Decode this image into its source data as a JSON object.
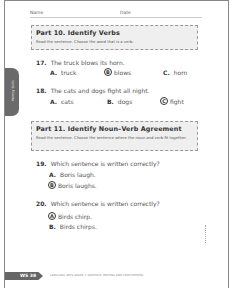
{
  "header": {
    "name_label": "Name",
    "date_label": "Date"
  },
  "side_tab": {
    "label": "Writing Skills"
  },
  "parts": [
    {
      "title": "Part 10. Identify Verbs",
      "instructions": "Read the sentence. Choose the word that is a verb."
    },
    {
      "title": "Part 11. Identify Noun–Verb Agreement",
      "instructions": "Read the sentence. Choose the sentence where the noun and verb fit together."
    }
  ],
  "questions": [
    {
      "number": "17.",
      "text": "The truck blows its horn.",
      "options": [
        {
          "letter": "A.",
          "text": "truck",
          "selected": false
        },
        {
          "letter": "B",
          "text": "blows",
          "selected": true
        },
        {
          "letter": "C.",
          "text": "horn",
          "selected": false
        }
      ]
    },
    {
      "number": "18.",
      "text": "The cats and dogs fight all night.",
      "options": [
        {
          "letter": "A.",
          "text": "cats",
          "selected": false
        },
        {
          "letter": "B.",
          "text": "dogs",
          "selected": false
        },
        {
          "letter": "C",
          "text": "fight",
          "selected": true
        }
      ]
    },
    {
      "number": "19.",
      "text": "Which sentence is written correctly?",
      "options": [
        {
          "letter": "A.",
          "text": "Boris laugh.",
          "selected": false
        },
        {
          "letter": "B",
          "text": "Boris laughs.",
          "selected": true
        }
      ]
    },
    {
      "number": "20.",
      "text": "Which sentence is written correctly?",
      "options": [
        {
          "letter": "A",
          "text": "Birds chirp.",
          "selected": true
        },
        {
          "letter": "B.",
          "text": "Birds chirps."
        }
      ]
    }
  ],
  "footer": {
    "page_code": "WS 38",
    "note": "LANGUAGE ARTS GRADE 1 SENTENCE WRITING AND CONVENTIONS"
  }
}
